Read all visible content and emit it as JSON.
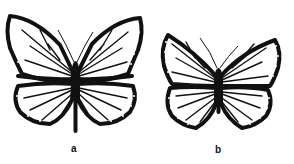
{
  "figure": {
    "panels": [
      {
        "id": "a",
        "label": "a",
        "subject": "butterfly",
        "description": "Butterfly with a dark horizontal band across both forewings and a long, extended abdomen"
      },
      {
        "id": "b",
        "label": "b",
        "subject": "butterfly",
        "description": "Smaller butterfly with similar wing venation pattern, dark bordered wings with white spots, shorter body"
      }
    ],
    "colors": {
      "ink": "#111111",
      "background": "#ffffff"
    }
  }
}
